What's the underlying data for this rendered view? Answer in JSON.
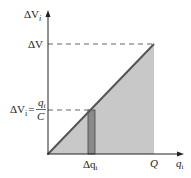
{
  "diagram": {
    "y_axis_label": "ΔV",
    "y_axis_sub": "i",
    "x_axis_label": "q",
    "x_axis_sub": "i",
    "top_value_label": "ΔV",
    "strip_value_label_lhs": "ΔV",
    "strip_value_label_lhs_sub": "i",
    "strip_value_eq": "=",
    "strip_value_num": "q",
    "strip_value_num_sub": "i",
    "strip_value_den": "C",
    "x_end_label": "Q",
    "strip_width_label": "Δq",
    "strip_width_sub": "i",
    "colors": {
      "fill": "#c8c8c8",
      "line": "#555555",
      "strip": "#8a8a8a",
      "axis": "#222222"
    }
  }
}
